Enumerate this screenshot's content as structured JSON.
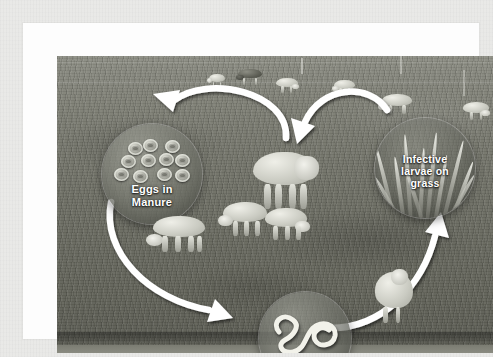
{
  "figure": {
    "type": "cycle-diagram",
    "frame_color": "#fdfdfd",
    "mat_color": "#e9e9e7",
    "photo_tone": "greyscale-pasture",
    "arrow_color": "#ffffff",
    "label_color": "#ffffff"
  },
  "nodes": [
    {
      "id": "eggs",
      "label": "Eggs in\nManure",
      "label_lines": [
        "Eggs in",
        "Manure"
      ],
      "icon": "eggs-cluster-icon",
      "egg_count": 11,
      "cx": 95,
      "cy": 118,
      "r": 50
    },
    {
      "id": "larvae",
      "label": "Larvae",
      "label_lines": [
        "Larvae"
      ],
      "icon": "coiled-worm-icon",
      "cx": 248,
      "cy": 282,
      "r": 46
    },
    {
      "id": "grass",
      "label": "Infective\nlarvae on\ngrass",
      "label_lines": [
        "Infective",
        "larvae on",
        "grass"
      ],
      "icon": "grass-blades-icon",
      "blade_count": 13,
      "cx": 368,
      "cy": 112,
      "r": 50
    }
  ],
  "arrows": [
    {
      "id": "arrow-sheep-to-eggs",
      "from": "sheep",
      "to": "eggs",
      "direction": "right-to-left",
      "position": "top-left"
    },
    {
      "id": "arrow-eggs-to-larvae",
      "from": "eggs",
      "to": "larvae",
      "direction": "down-right",
      "position": "left"
    },
    {
      "id": "arrow-larvae-to-grass",
      "from": "larvae",
      "to": "grass",
      "direction": "up-right",
      "position": "bottom-right"
    },
    {
      "id": "arrow-grass-to-sheep",
      "from": "grass",
      "to": "sheep",
      "direction": "right-to-left",
      "position": "top-right"
    }
  ],
  "photo": {
    "subject": "flock of sheep grazing on pasture",
    "sheep_count": 12
  }
}
